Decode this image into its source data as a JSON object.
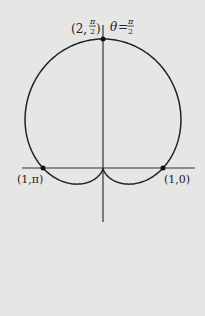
{
  "figure": {
    "equation": "r = 1 + sin θ",
    "curve_type": "cardioid",
    "labels": {
      "top_point": {
        "prefix": "(2,",
        "num": "π",
        "den": "2",
        "suffix": ")"
      },
      "axis_angle": {
        "prefix": "θ=",
        "num": "π",
        "den": "2"
      },
      "left_point": "(1,π)",
      "right_point": "(1,0)"
    },
    "colors": {
      "background": "#e6e6e4",
      "ink": "#222222"
    }
  }
}
